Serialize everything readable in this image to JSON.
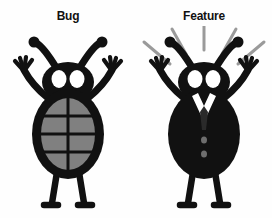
{
  "image": {
    "kind": "two-panel-cartoon-illustration",
    "background_color": "#fefefe",
    "width": 272,
    "height": 218
  },
  "panels": [
    {
      "id": "bug",
      "title": "Bug",
      "figure_name": "bug-character",
      "description": "Cartoon beetle standing upright with both arms raised, antennae curled, two white eyes, oval gray segmented shell on torso, two thin legs with small feet",
      "body_fill": "#111111",
      "shell_fill": "#808080",
      "eye_fill": "#ffffff",
      "shell_segments": {
        "vertical_lines": 1,
        "horizontal_lines": 3
      },
      "has_rays": false,
      "has_suit": false
    },
    {
      "id": "feature",
      "title": "Feature",
      "figure_name": "feature-character",
      "description": "Same cartoon beetle standing upright with both arms raised, now wearing a black business suit with a white V collar, dark necktie and two buttons, with five light rays radiating upward above its head",
      "body_fill": "#111111",
      "suit_fill": "#111111",
      "collar_fill": "#ffffff",
      "tie_fill": "#2a2a2a",
      "button_fill": "#6e6e6e",
      "eye_fill": "#ffffff",
      "has_rays": true,
      "has_suit": true,
      "ray_count": 5,
      "ray_color": "#9a9a9a"
    }
  ],
  "colors": {
    "ink": "#111111",
    "shell_gray": "#808080",
    "ray_gray": "#9a9a9a",
    "white": "#ffffff",
    "background": "#fefefe"
  }
}
